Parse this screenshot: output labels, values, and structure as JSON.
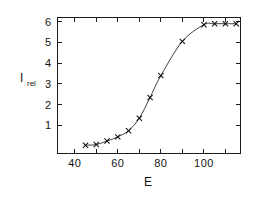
{
  "chart_data": {
    "type": "line",
    "title": "",
    "subtitle": "",
    "xlabel": "E",
    "ylabel": "I_rel",
    "ylabel_base": "I",
    "ylabel_subscript": "rel",
    "xlim": [
      32,
      117
    ],
    "ylim": [
      -0.35,
      6.2
    ],
    "grid": false,
    "legend": null,
    "frame": "box",
    "marker_style": "x",
    "line_style": "solid",
    "color": "#1c1c1c",
    "x_major_ticks": [
      40,
      60,
      80,
      100
    ],
    "x_major_tick_labels": [
      "40",
      "60",
      "80",
      "100"
    ],
    "x_minor_ticks": [
      50,
      70,
      90,
      110
    ],
    "y_major_ticks": [
      1,
      2,
      3,
      4,
      5,
      6
    ],
    "y_major_tick_labels": [
      "1",
      "2",
      "3",
      "4",
      "5",
      "6"
    ],
    "series": [
      {
        "name": "I_rel vs E",
        "x": [
          45,
          50,
          55,
          60,
          65,
          70,
          75,
          80,
          90,
          100,
          105,
          110,
          115
        ],
        "y": [
          0.05,
          0.08,
          0.25,
          0.45,
          0.75,
          1.35,
          2.35,
          3.4,
          5.05,
          5.85,
          5.9,
          5.9,
          5.9
        ]
      }
    ]
  },
  "figure": {
    "background_color": "#ffffff",
    "ink_color": "#1c1c1c"
  }
}
